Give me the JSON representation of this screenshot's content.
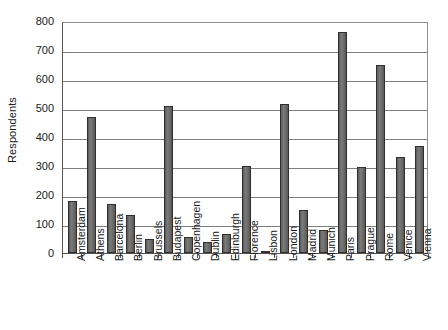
{
  "chart_data": {
    "type": "bar",
    "title": "",
    "subtitle": "",
    "xlabel": "",
    "ylabel": "Respondents",
    "ylim": [
      0,
      800
    ],
    "ytick_step": 100,
    "yticks": [
      "0",
      "100",
      "200",
      "300",
      "400",
      "500",
      "600",
      "700",
      "800"
    ],
    "grid": true,
    "legend": false,
    "legend_position": "none",
    "bar_color": "#6e6e6e",
    "bar_edge_color": "#2f2f2f",
    "categories": [
      "Amsterdam",
      "Athens",
      "Barcelona",
      "Berlin",
      "Brussels",
      "Budapest",
      "Copenhagen",
      "Dublin",
      "Edinburgh",
      "Florence",
      "Lisbon",
      "London",
      "Madrid",
      "Munich",
      "Paris",
      "Prague",
      "Rome",
      "Venice",
      "Vienna"
    ],
    "values": [
      180,
      468,
      168,
      130,
      50,
      508,
      55,
      38,
      65,
      300,
      5,
      515,
      150,
      80,
      762,
      295,
      648,
      330,
      368
    ]
  }
}
